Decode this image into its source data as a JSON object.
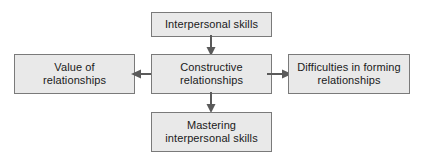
{
  "diagram": {
    "type": "flowchart",
    "background_color": "#ffffff",
    "node_fill_color": "#e9e9e9",
    "node_border_color": "#7a7a7a",
    "connector_color": "#5a5a5a",
    "nodes": [
      {
        "id": "interpersonal-skills",
        "label": "Interpersonal skills",
        "position": "top"
      },
      {
        "id": "constructive-relationships",
        "label": "Constructive\nrelationships",
        "position": "center"
      },
      {
        "id": "value-of-relationships",
        "label": "Value of\nrelationships",
        "position": "left"
      },
      {
        "id": "difficulties-forming-relationships",
        "label": "Difficulties in forming\nrelationships",
        "position": "right"
      },
      {
        "id": "mastering-interpersonal-skills",
        "label": "Mastering\ninterpersonal skills",
        "position": "bottom"
      }
    ],
    "connectors": [
      {
        "id": "top-to-center",
        "from": "interpersonal-skills",
        "to": "constructive-relationships",
        "direction": "down"
      },
      {
        "id": "center-to-bottom",
        "from": "constructive-relationships",
        "to": "mastering-interpersonal-skills",
        "direction": "down"
      },
      {
        "id": "center-to-left",
        "from": "constructive-relationships",
        "to": "value-of-relationships",
        "direction": "left"
      },
      {
        "id": "center-to-right",
        "from": "constructive-relationships",
        "to": "difficulties-forming-relationships",
        "direction": "right"
      }
    ]
  }
}
